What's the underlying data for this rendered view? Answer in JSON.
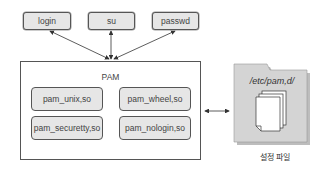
{
  "diagram": {
    "apps": [
      {
        "label": "login"
      },
      {
        "label": "su"
      },
      {
        "label": "passwd"
      }
    ],
    "pam": {
      "title": "PAM",
      "modules": [
        {
          "label": "pam_unix,so"
        },
        {
          "label": "pam_wheel,so"
        },
        {
          "label": "pam_securetty,so"
        },
        {
          "label": "pam_nologin,so"
        }
      ]
    },
    "config": {
      "folder_label": "/etc/pam,d/",
      "caption": "설정 파일",
      "icon": "folder-with-documents-icon"
    },
    "colors": {
      "box_fill": "#e6e6e6",
      "border": "#555555",
      "folder_fill": "#d4d4d4"
    }
  }
}
